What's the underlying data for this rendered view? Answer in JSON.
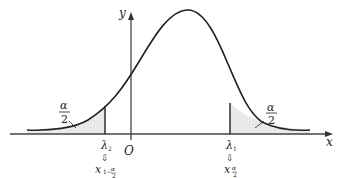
{
  "diagram": {
    "title": "",
    "axes": {
      "x_label": "x",
      "y_label": "y",
      "origin_label": "O"
    },
    "curve": "normal density (bell curve), peak to the right of y-axis",
    "left_tail": {
      "area_label_num": "α",
      "area_label_den": "2",
      "quantile_label": "λ",
      "quantile_sub": "2",
      "arrow": "⇩",
      "equiv_main": "x",
      "equiv_sub": "1−α/2"
    },
    "right_tail": {
      "area_label_num": "α",
      "area_label_den": "2",
      "quantile_label": "λ",
      "quantile_sub": "1",
      "arrow": "⇩",
      "equiv_main": "x",
      "equiv_sub": "α/2"
    },
    "colors": {
      "line": "#222222",
      "shade": "#e2e2e2",
      "axis": "#444444"
    }
  }
}
